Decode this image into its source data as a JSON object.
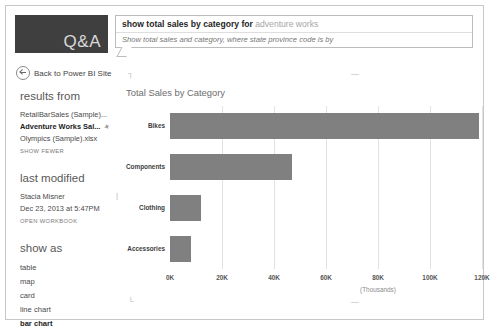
{
  "app": {
    "logo_text": "Q&A",
    "back_label": "Back to Power BI Site"
  },
  "search": {
    "query_typed": "show total sales by category for",
    "query_suggestion": "adventure works",
    "interpretation": "Show total sales and category, where state province code is by"
  },
  "sidebar": {
    "results_from": {
      "title": "results from",
      "items": [
        {
          "label": "RetailBarSales (Sample)...",
          "selected": false
        },
        {
          "label": "Adventure Works Sal...",
          "selected": true
        },
        {
          "label": "Olympics (Sample).xlsx",
          "selected": false
        }
      ],
      "show_fewer": "SHOW FEWER"
    },
    "last_modified": {
      "title": "last modified",
      "author": "Stacia Misner",
      "timestamp": "Dec 23, 2013 at 5:47PM",
      "open_workbook": "OPEN WORKBOOK"
    },
    "show_as": {
      "title": "show as",
      "options": [
        {
          "label": "table",
          "selected": false
        },
        {
          "label": "map",
          "selected": false
        },
        {
          "label": "card",
          "selected": false
        },
        {
          "label": "line chart",
          "selected": false
        },
        {
          "label": "bar chart",
          "selected": true
        }
      ]
    }
  },
  "chart_data": {
    "type": "bar",
    "orientation": "horizontal",
    "title": "Total Sales by Category",
    "categories": [
      "Bikes",
      "Components",
      "Clothing",
      "Accessories"
    ],
    "values": [
      119000,
      47000,
      12000,
      8000
    ],
    "xlabel": "(Thousands)",
    "ylabel": "",
    "xlim": [
      0,
      120000
    ],
    "ticks": [
      "0K",
      "20K",
      "40K",
      "60K",
      "80K",
      "100K",
      "120K"
    ],
    "tick_values": [
      0,
      20000,
      40000,
      60000,
      80000,
      100000,
      120000
    ],
    "grid": true,
    "legend": false,
    "bar_color": "#808080"
  }
}
